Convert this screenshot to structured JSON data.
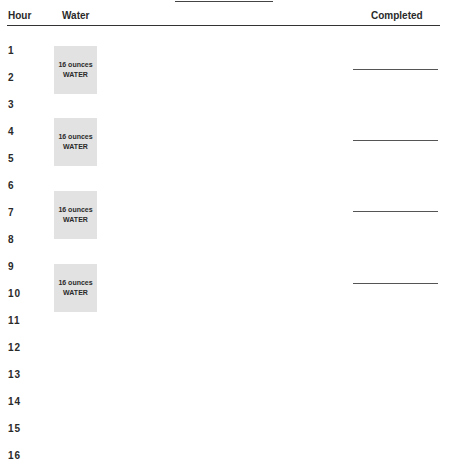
{
  "header": {
    "hour_label": "Hour",
    "water_label": "Water",
    "completed_label": "Completed"
  },
  "hours": [
    "1",
    "2",
    "3",
    "4",
    "5",
    "6",
    "7",
    "8",
    "9",
    "10",
    "11",
    "12",
    "13",
    "14",
    "15",
    "16"
  ],
  "water_boxes": [
    {
      "amount": "16 ounces",
      "label": "WATER"
    },
    {
      "amount": "16 ounces",
      "label": "WATER"
    },
    {
      "amount": "16 ounces",
      "label": "WATER"
    },
    {
      "amount": "16 ounces",
      "label": "WATER"
    }
  ]
}
